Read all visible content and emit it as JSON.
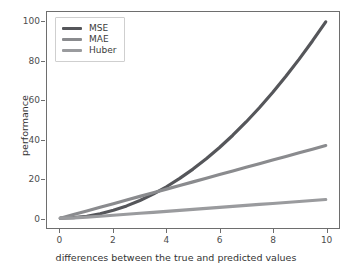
{
  "chart_data": {
    "type": "line",
    "title": "",
    "xlabel": "differences between the true and predicted values",
    "ylabel": "performance",
    "xlim": [
      -0.5,
      10.5
    ],
    "ylim": [
      -5,
      105
    ],
    "xticks": [
      0,
      2,
      4,
      6,
      8,
      10
    ],
    "yticks": [
      0,
      20,
      40,
      60,
      80,
      100
    ],
    "grid": false,
    "legend_position": "upper left",
    "x": [
      0,
      0.5,
      1,
      1.5,
      2,
      2.5,
      3,
      3.5,
      4,
      4.5,
      5,
      5.5,
      6,
      6.5,
      7,
      7.5,
      8,
      8.5,
      9,
      9.5,
      10
    ],
    "series": [
      {
        "name": "MSE",
        "color": "#55565a",
        "values": [
          0,
          0.25,
          1,
          2.25,
          4,
          6.25,
          9,
          12.25,
          16,
          20.25,
          25,
          30.25,
          36,
          42.25,
          49,
          56.25,
          64,
          72.25,
          81,
          90.25,
          100
        ]
      },
      {
        "name": "MAE",
        "color": "#8a8b8e",
        "values": [
          0,
          1.85,
          3.7,
          5.55,
          7.4,
          9.25,
          11.1,
          12.95,
          14.8,
          16.65,
          18.5,
          20.35,
          22.2,
          24.05,
          25.9,
          27.75,
          29.6,
          31.45,
          33.3,
          35.15,
          37
        ]
      },
      {
        "name": "Huber",
        "color": "#9a9b9e",
        "values": [
          0,
          0.125,
          0.5,
          1.0,
          1.5,
          2.0,
          2.5,
          3.0,
          3.5,
          4.0,
          4.5,
          5.0,
          5.5,
          6.0,
          6.5,
          7.0,
          7.5,
          8.0,
          8.5,
          9.0,
          9.5
        ]
      }
    ]
  },
  "legend": {
    "entries": [
      {
        "label": "MSE"
      },
      {
        "label": "MAE"
      },
      {
        "label": "Huber"
      }
    ]
  },
  "axes": {
    "xlabel": "differences between the true and predicted values",
    "ylabel": "performance",
    "xticklabels": [
      "0",
      "2",
      "4",
      "6",
      "8",
      "10"
    ],
    "yticklabels": [
      "0",
      "20",
      "40",
      "60",
      "80",
      "100"
    ]
  },
  "colors": {
    "frame": "#6e6e6e",
    "background": "#ffffff",
    "tick_text": "#4d4d4d",
    "label_text": "#333333"
  }
}
